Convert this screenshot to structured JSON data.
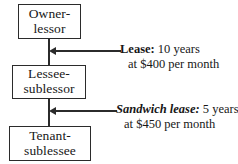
{
  "diagram": {
    "type": "lease-hierarchy-flow-diagram",
    "nodes": [
      {
        "id": "owner-lessor",
        "line1": "Owner-",
        "line2": "lessor"
      },
      {
        "id": "lessee-sublessor",
        "line1": "Lessee-",
        "line2": "sublessor"
      },
      {
        "id": "tenant-sublessee",
        "line1": "Tenant-",
        "line2": "sublessee"
      }
    ],
    "annotations": [
      {
        "id": "lease",
        "label": "Lease:",
        "label_style": "bold",
        "term": " 10 years",
        "line2": "at $400 per month",
        "duration_years": 10,
        "rent_amount": "$400",
        "rent_period": "per month"
      },
      {
        "id": "sandwich-lease",
        "label": "Sandwich lease:",
        "label_style": "bold-italic",
        "term": " 5 years",
        "line2": "at $450 per month",
        "duration_years": 5,
        "rent_amount": "$450",
        "rent_period": "per month"
      }
    ],
    "colors": {
      "stroke": "#2b2b2b",
      "text": "#171717",
      "background": "#ffffff"
    }
  }
}
